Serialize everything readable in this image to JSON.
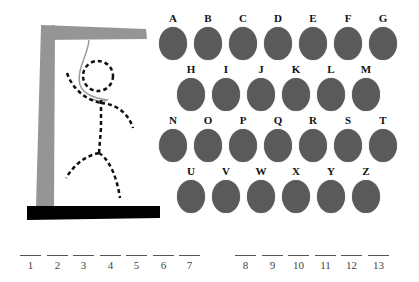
{
  "game": "hangman",
  "colors": {
    "disc": "#5a5a5a",
    "gallows": "#959595",
    "base": "#000000",
    "figure": "#111111",
    "rope": "#9a9a9a"
  },
  "letters": [
    "A",
    "B",
    "C",
    "D",
    "E",
    "F",
    "G",
    "H",
    "I",
    "J",
    "K",
    "L",
    "M",
    "N",
    "O",
    "P",
    "Q",
    "R",
    "S",
    "T",
    "U",
    "V",
    "W",
    "X",
    "Y",
    "Z"
  ],
  "rows": [
    {
      "start": 0,
      "count": 7,
      "x0": 158,
      "y": 13
    },
    {
      "start": 7,
      "count": 6,
      "x0": 176,
      "y": 64
    },
    {
      "start": 13,
      "count": 7,
      "x0": 158,
      "y": 115
    },
    {
      "start": 20,
      "count": 6,
      "x0": 176,
      "y": 166
    }
  ],
  "blanks": [
    {
      "n": "1",
      "x": 20
    },
    {
      "n": "2",
      "x": 47
    },
    {
      "n": "3",
      "x": 73
    },
    {
      "n": "4",
      "x": 100
    },
    {
      "n": "5",
      "x": 126
    },
    {
      "n": "6",
      "x": 153
    },
    {
      "n": "7",
      "x": 179
    },
    {
      "n": "8",
      "x": 235
    },
    {
      "n": "9",
      "x": 262
    },
    {
      "n": "10",
      "x": 288
    },
    {
      "n": "11",
      "x": 315
    },
    {
      "n": "12",
      "x": 341
    },
    {
      "n": "13",
      "x": 368
    }
  ]
}
